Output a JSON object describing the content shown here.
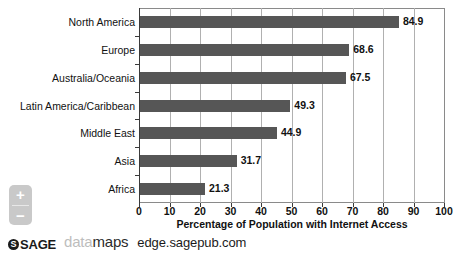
{
  "chart_data": {
    "type": "bar",
    "orientation": "horizontal",
    "title": "",
    "subtitle": "",
    "xlabel": "Percentage of Population with Internet Access",
    "ylabel": "",
    "categories": [
      "North America",
      "Europe",
      "Australia/Oceania",
      "Latin America/Caribbean",
      "Middle East",
      "Asia",
      "Africa"
    ],
    "values": [
      84.9,
      68.6,
      67.5,
      49.3,
      44.9,
      31.7,
      21.3
    ],
    "value_labels": [
      "84.9",
      "68.6",
      "67.5",
      "49.3",
      "44.9",
      "31.7",
      "21.3"
    ],
    "xlim": [
      0,
      100
    ],
    "xticks": [
      0,
      10,
      20,
      30,
      40,
      50,
      60,
      70,
      80,
      90,
      100
    ],
    "xtick_labels": [
      "0",
      "10",
      "20",
      "30",
      "40",
      "50",
      "60",
      "70",
      "80",
      "90",
      "100"
    ],
    "grid": "vertical",
    "legend": "none",
    "bar_color": "#565656",
    "gridline_color": "#b0b0b0",
    "axis_color": "#3a3a3a",
    "background": "#ffffff"
  },
  "zoom_control": {
    "zoom_in_label": "+",
    "zoom_out_label": "−",
    "zoom_in_name": "zoom in",
    "zoom_out_name": "zoom out"
  },
  "footer": {
    "sage_badge": "S",
    "sage_text": "SAGE",
    "datamaps_first": "data",
    "datamaps_second": "maps",
    "url": "edge.sagepub.com"
  }
}
